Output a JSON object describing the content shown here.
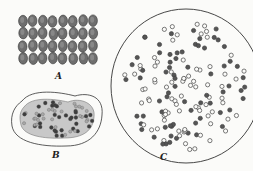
{
  "figure": {
    "panels": [
      {
        "id": "A",
        "label": "A",
        "description": "tightly packed cells in regular grid",
        "rows": 4,
        "columns": 8
      },
      {
        "id": "B",
        "label": "B",
        "description": "kidney-shaped capsule containing mass of cells"
      },
      {
        "id": "C",
        "label": "C",
        "description": "large circular colony with scattered cells"
      }
    ],
    "colors": {
      "ink": "#333333",
      "cell_dark": "#555555",
      "cell_light": "#9a9a9a",
      "background": "#fbfbf9"
    }
  }
}
